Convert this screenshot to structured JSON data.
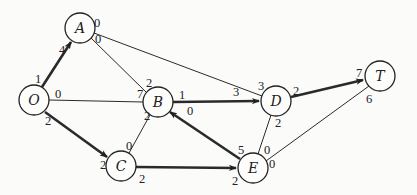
{
  "nodes": [
    {
      "id": "O",
      "label": "O",
      "x": 34,
      "y": 100
    },
    {
      "id": "A",
      "label": "A",
      "x": 80,
      "y": 28
    },
    {
      "id": "B",
      "label": "B",
      "x": 158,
      "y": 102
    },
    {
      "id": "C",
      "label": "C",
      "x": 121,
      "y": 166
    },
    {
      "id": "D",
      "label": "D",
      "x": 276,
      "y": 101
    },
    {
      "id": "E",
      "label": "E",
      "x": 253,
      "y": 168
    },
    {
      "id": "T",
      "label": "T",
      "x": 380,
      "y": 76
    }
  ],
  "edges": [
    {
      "from": "O",
      "to": "A",
      "bold": true,
      "from_label": "1",
      "to_label": "4"
    },
    {
      "from": "O",
      "to": "B",
      "bold": false,
      "from_label": "0",
      "to_label": "7"
    },
    {
      "from": "O",
      "to": "C",
      "bold": true,
      "from_label": "2",
      "to_label": "2"
    },
    {
      "from": "A",
      "to": "B",
      "bold": false,
      "from_label": "0",
      "to_label": "2"
    },
    {
      "from": "A",
      "to": "D",
      "bold": false,
      "from_label": "0",
      "to_label": "3"
    },
    {
      "from": "B",
      "to": "C",
      "bold": false,
      "from_label": "2",
      "to_label": "0"
    },
    {
      "from": "B",
      "to": "D",
      "bold": true,
      "from_label": "1",
      "to_label": "3"
    },
    {
      "from": "E",
      "to": "B",
      "bold": true,
      "from_label": "5",
      "to_label": "0"
    },
    {
      "from": "C",
      "to": "E",
      "bold": true,
      "from_label": "2",
      "to_label": "2"
    },
    {
      "from": "D",
      "to": "E",
      "bold": false,
      "from_label": "2",
      "to_label": "0"
    },
    {
      "from": "D",
      "to": "T",
      "bold": true,
      "from_label": "2",
      "to_label": "7"
    },
    {
      "from": "E",
      "to": "T",
      "bold": false,
      "from_label": "0",
      "to_label": "6"
    }
  ],
  "labels": {
    "O_A_from": "1",
    "O_A_to": "4",
    "O_B_from": "0",
    "O_B_to": "7",
    "O_C_from": "2",
    "O_C_to": "2",
    "A_B_from": "0",
    "A_B_to": "2",
    "A_D_from": "0",
    "A_D_to": "3",
    "B_C_from": "2",
    "B_C_to": "0",
    "B_D_from": "1",
    "B_D_to": "3",
    "E_B_from": "5",
    "E_B_to": "0",
    "C_E_from": "2",
    "C_E_to": "2",
    "D_E_from": "2",
    "D_E_to": "0",
    "D_T_from": "2",
    "D_T_to": "7",
    "E_T_from": "0",
    "E_T_to": "6"
  },
  "node_labels": {
    "O": "O",
    "A": "A",
    "B": "B",
    "C": "C",
    "D": "D",
    "E": "E",
    "T": "T"
  }
}
